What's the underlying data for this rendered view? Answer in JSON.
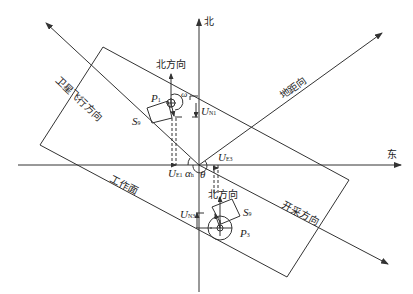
{
  "diagram": {
    "type": "geometric-schematic",
    "axes": {
      "north": "北",
      "east": "东"
    },
    "directions": {
      "satellite_flight": "卫星飞行方向",
      "ground_range": "地距向",
      "mining": "开采方向",
      "working_face": "工作面"
    },
    "points": {
      "p1": {
        "main": "P",
        "sub": "1",
        "north_label": "北方向",
        "segment": "S",
        "segment_sub": "9"
      },
      "p3": {
        "main": "P",
        "sub": "3",
        "north_label": "北方向",
        "segment": "S",
        "segment_sub": "9"
      }
    },
    "symbols": {
      "omega": "ω",
      "un1": {
        "main": "U",
        "sub": "N1"
      },
      "ue1": {
        "main": "U",
        "sub": "E1"
      },
      "ue3": {
        "main": "U",
        "sub": "E3"
      },
      "un3": {
        "main": "U",
        "sub": "N3"
      },
      "alpha": {
        "main": "α",
        "sub": "h"
      },
      "theta": "θ"
    },
    "colors": {
      "line": "#333333",
      "background": "#ffffff"
    }
  }
}
